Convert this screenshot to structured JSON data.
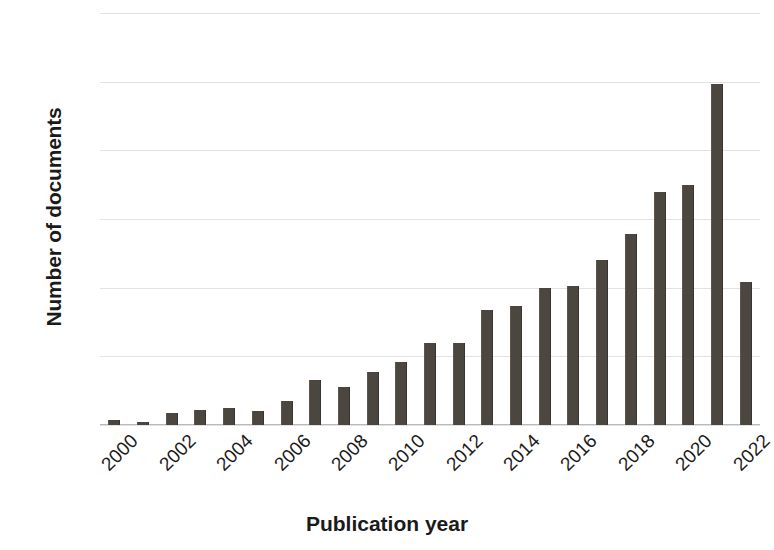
{
  "chart_data": {
    "type": "bar",
    "title": "",
    "xlabel": "Publication year",
    "ylabel": "Number of documents",
    "categories": [
      "2000",
      "2001",
      "2002",
      "2003",
      "2004",
      "2005",
      "2006",
      "2007",
      "2008",
      "2009",
      "2010",
      "2011",
      "2012",
      "2013",
      "2014",
      "2015",
      "2016",
      "2017",
      "2018",
      "2019",
      "2020",
      "2021",
      "2022"
    ],
    "values": [
      8,
      5,
      17,
      22,
      25,
      20,
      35,
      65,
      55,
      77,
      92,
      120,
      120,
      168,
      174,
      199,
      203,
      241,
      278,
      340,
      350,
      497,
      208
    ],
    "ylim": [
      0,
      600
    ],
    "y_ticks": [
      0,
      100,
      200,
      300,
      400,
      500,
      600
    ],
    "y_tick_labels": [
      "0",
      "100",
      "200",
      "300",
      "400",
      "500",
      "600"
    ],
    "x_tick_labels": [
      "2000",
      "2002",
      "2004",
      "2006",
      "2008",
      "2010",
      "2012",
      "2014",
      "2016",
      "2018",
      "2020",
      "2022"
    ],
    "x_tick_label_rotation": -45,
    "grid": true,
    "legend": null,
    "bar_color": "#4c4641",
    "grid_color": "#e2e2e2",
    "axis_color": "#b9b9b9",
    "text_color": "#1a1a1a",
    "background": "#ffffff"
  }
}
